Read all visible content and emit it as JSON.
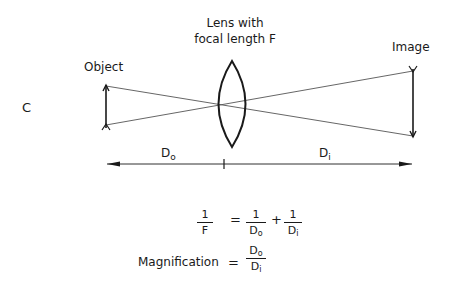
{
  "panel_label": "C",
  "lens": {
    "label_line1": "Lens with",
    "label_line2": "focal length F"
  },
  "object_label": "Object",
  "image_label": "Image",
  "distances": {
    "object_distance": {
      "main": "D",
      "sub": "o"
    },
    "image_distance": {
      "main": "D",
      "sub": "i"
    }
  },
  "equations": {
    "lens_equation": {
      "lhs": {
        "num": "1",
        "den": "F"
      },
      "equals": "=",
      "rhs1": {
        "num": "1",
        "den_main": "D",
        "den_sub": "o"
      },
      "plus": "+",
      "rhs2": {
        "num": "1",
        "den_main": "D",
        "den_sub": "i"
      }
    },
    "magnification": {
      "label": "Magnification",
      "equals": "=",
      "num_main": "D",
      "num_sub": "o",
      "den_main": "D",
      "den_sub": "i"
    }
  },
  "colors": {
    "stroke": "#1a1a1a",
    "ray": "#555555",
    "background": "#ffffff"
  }
}
